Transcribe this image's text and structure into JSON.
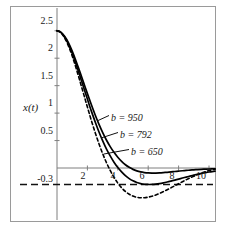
{
  "chart_data": {
    "type": "line",
    "title": "",
    "xlabel": "",
    "ylabel": "x(t)",
    "xlim": [
      0,
      10.6
    ],
    "ylim": [
      -0.62,
      2.72
    ],
    "grid": false,
    "legend_position": "inline-annotations",
    "xticks": [
      2,
      4,
      6,
      8,
      10
    ],
    "xtick_labels": [
      "2",
      "4",
      "6",
      "8",
      "10"
    ],
    "yticks": [
      0.5,
      1,
      1.5,
      2,
      2.5
    ],
    "ytick_labels": [
      "0.5",
      "1",
      "1.5",
      "2",
      "2.5"
    ],
    "reference_lines": [
      {
        "name": "zero-axis",
        "axis": "y",
        "value": 0,
        "style": "solid"
      },
      {
        "name": "minus-zero-point-three",
        "axis": "y",
        "value": -0.3,
        "style": "dashed",
        "label": "-0.3"
      }
    ],
    "annotations": [
      {
        "text": "b = 950",
        "x": 4.0,
        "y": 0.86
      },
      {
        "text": "b = 792",
        "x": 4.6,
        "y": 0.56
      },
      {
        "text": "b = 650",
        "x": 5.3,
        "y": 0.26
      }
    ],
    "series": [
      {
        "name": "b = 950",
        "label": "b = 950",
        "style": "solid",
        "color": "#000000",
        "x": [
          0,
          0.25,
          0.5,
          0.75,
          1,
          1.25,
          1.5,
          1.75,
          2,
          2.25,
          2.5,
          2.75,
          3,
          3.25,
          3.5,
          3.75,
          4,
          4.25,
          4.5,
          4.75,
          5,
          5.25,
          5.5,
          5.75,
          6,
          6.25,
          6.5,
          6.75,
          7,
          7.25,
          7.5,
          7.75,
          8,
          8.25,
          8.5,
          8.75,
          9,
          9.25,
          9.5,
          9.75,
          10,
          10.4
        ],
        "y": [
          2.5,
          2.475,
          2.4,
          2.285,
          2.13,
          1.95,
          1.755,
          1.555,
          1.355,
          1.16,
          0.975,
          0.805,
          0.65,
          0.51,
          0.39,
          0.285,
          0.195,
          0.12,
          0.06,
          0.012,
          -0.025,
          -0.052,
          -0.071,
          -0.083,
          -0.09,
          -0.093,
          -0.092,
          -0.089,
          -0.084,
          -0.078,
          -0.071,
          -0.064,
          -0.057,
          -0.05,
          -0.044,
          -0.038,
          -0.033,
          -0.028,
          -0.024,
          -0.021,
          -0.018,
          -0.014
        ]
      },
      {
        "name": "b = 792",
        "label": "b = 792",
        "style": "solid",
        "color": "#000000",
        "x": [
          0,
          0.25,
          0.5,
          0.75,
          1,
          1.25,
          1.5,
          1.75,
          2,
          2.25,
          2.5,
          2.75,
          3,
          3.25,
          3.5,
          3.75,
          4,
          4.25,
          4.5,
          4.75,
          5,
          5.25,
          5.5,
          5.75,
          6,
          6.25,
          6.5,
          6.75,
          7,
          7.25,
          7.5,
          7.75,
          8,
          8.25,
          8.5,
          8.75,
          9,
          9.25,
          9.5,
          9.75,
          10,
          10.4
        ],
        "y": [
          2.5,
          2.47,
          2.385,
          2.255,
          2.09,
          1.895,
          1.685,
          1.47,
          1.255,
          1.045,
          0.85,
          0.665,
          0.5,
          0.35,
          0.22,
          0.105,
          0.008,
          -0.072,
          -0.14,
          -0.193,
          -0.234,
          -0.264,
          -0.284,
          -0.296,
          -0.3,
          -0.299,
          -0.293,
          -0.283,
          -0.27,
          -0.255,
          -0.238,
          -0.22,
          -0.202,
          -0.183,
          -0.165,
          -0.147,
          -0.13,
          -0.114,
          -0.099,
          -0.085,
          -0.073,
          -0.058
        ]
      },
      {
        "name": "b = 650",
        "label": "b = 650",
        "style": "dashed",
        "color": "#000000",
        "x": [
          0,
          0.25,
          0.5,
          0.75,
          1,
          1.25,
          1.5,
          1.75,
          2,
          2.25,
          2.5,
          2.75,
          3,
          3.25,
          3.5,
          3.75,
          4,
          4.25,
          4.5,
          4.75,
          5,
          5.25,
          5.5,
          5.75,
          6,
          6.25,
          6.5,
          6.75,
          7,
          7.25,
          7.5,
          7.75,
          8,
          8.25,
          8.5,
          8.75,
          9,
          9.25,
          9.5,
          9.75,
          10,
          10.4
        ],
        "y": [
          2.5,
          2.465,
          2.37,
          2.225,
          2.04,
          1.825,
          1.59,
          1.35,
          1.11,
          0.875,
          0.655,
          0.45,
          0.265,
          0.1,
          -0.045,
          -0.17,
          -0.275,
          -0.36,
          -0.428,
          -0.478,
          -0.512,
          -0.533,
          -0.542,
          -0.541,
          -0.531,
          -0.514,
          -0.49,
          -0.462,
          -0.43,
          -0.396,
          -0.36,
          -0.323,
          -0.286,
          -0.25,
          -0.215,
          -0.181,
          -0.15,
          -0.12,
          -0.093,
          -0.069,
          -0.047,
          -0.022
        ]
      }
    ]
  },
  "axis_label": "x(t)",
  "minus_label": "-0.3"
}
